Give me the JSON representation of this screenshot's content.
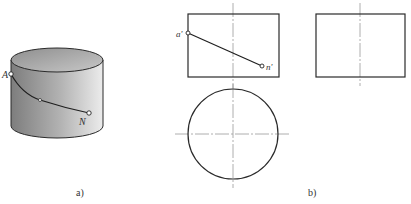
{
  "figure": {
    "panel_a": {
      "caption": "a)",
      "points": {
        "A": "A",
        "N": "N"
      }
    },
    "panel_b": {
      "caption": "b)",
      "points": {
        "a_prime": "a'",
        "n_prime": "n'"
      }
    }
  },
  "colors": {
    "line": "#2a2a2a",
    "centerline": "#9a9a9a",
    "cylinder_dark": "#7a7a7a",
    "cylinder_light": "#e6e6e6"
  }
}
